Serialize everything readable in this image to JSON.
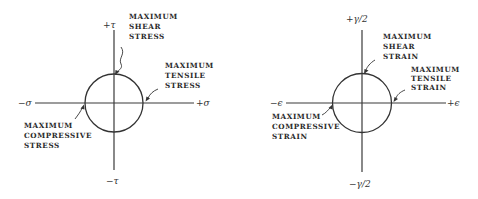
{
  "diagrams": [
    {
      "name": "stress",
      "axis_labels": {
        "pos_x": "+σ",
        "neg_x": "−σ",
        "pos_y": "+τ",
        "neg_y": "−τ"
      },
      "annotations": {
        "shear": [
          "MAXIMUM",
          "SHEAR",
          "STRESS"
        ],
        "tensile": [
          "MAXIMUM",
          "TENSILE",
          "STRESS"
        ],
        "compressive": [
          "MAXIMUM",
          "COMPRESSIVE",
          "STRESS"
        ]
      }
    },
    {
      "name": "strain",
      "axis_labels": {
        "pos_x": "+ϵ",
        "neg_x": "−ϵ",
        "pos_y": "+γ/2",
        "neg_y": "−γ/2"
      },
      "annotations": {
        "shear": [
          "MAXIMUM",
          "SHEAR",
          "STRAIN"
        ],
        "tensile": [
          "MAXIMUM",
          "TENSILE",
          "STRAIN"
        ],
        "compressive": [
          "MAXIMUM",
          "COMPRESSIVE",
          "STRAIN"
        ]
      }
    }
  ]
}
